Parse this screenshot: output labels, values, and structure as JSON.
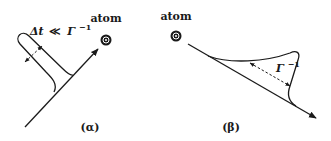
{
  "panels": [
    {
      "id": "alpha",
      "caption": "(α)",
      "atom_label": "atom",
      "annotation": {
        "delta_t": "Δt",
        "relation": "≪",
        "gamma": "Γ",
        "exponent": "−1"
      },
      "description": "Photon wave packet (short, Δt ≪ Γ⁻¹) travels toward the atom"
    },
    {
      "id": "beta",
      "caption": "(β)",
      "atom_label": "atom",
      "annotation": {
        "gamma": "Γ",
        "exponent": "−1"
      },
      "description": "Emitted wave packet with exponential tail of duration Γ⁻¹ travels away from the atom"
    }
  ],
  "colors": {
    "ink": "#1a1a1a",
    "background": "#ffffff"
  }
}
